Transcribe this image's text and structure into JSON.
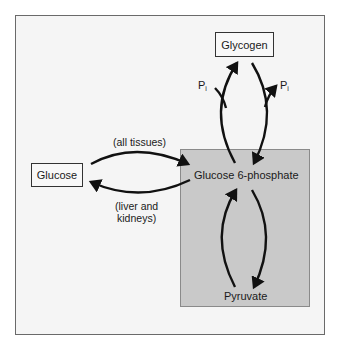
{
  "diagram": {
    "nodes": {
      "glycogen": "Glycogen",
      "glucose": "Glucose",
      "g6p": "Glucose 6-phosphate",
      "pyruvate": "Pyruvate"
    },
    "labels": {
      "all_tissues": "(all tissues)",
      "liver_kidneys_line1": "(liver and",
      "liver_kidneys_line2": "kidneys)",
      "pi_left": "P",
      "pi_left_sub": "i",
      "pi_right": "P",
      "pi_right_sub": "i"
    },
    "edges": [
      {
        "from": "Glucose",
        "to": "Glucose 6-phosphate",
        "label": "(all tissues)"
      },
      {
        "from": "Glucose 6-phosphate",
        "to": "Glucose",
        "label": "(liver and kidneys)"
      },
      {
        "from": "Glucose 6-phosphate",
        "to": "Glycogen",
        "cofactor": "Pi in"
      },
      {
        "from": "Glycogen",
        "to": "Glucose 6-phosphate",
        "cofactor": "Pi in"
      },
      {
        "from": "Pyruvate",
        "to": "Glucose 6-phosphate"
      },
      {
        "from": "Glucose 6-phosphate",
        "to": "Pyruvate"
      }
    ],
    "colors": {
      "frame_bg": "#f5f5f5",
      "region_bg": "#c9c9c9",
      "arrow": "#111111"
    }
  }
}
